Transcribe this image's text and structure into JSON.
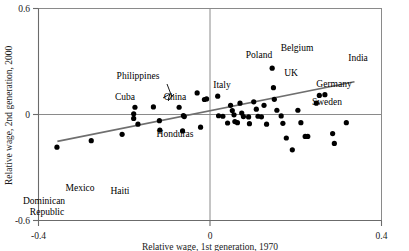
{
  "chart_data": {
    "type": "scatter",
    "title": "",
    "xlabel": "Relative wage, 1st generation, 1970",
    "ylabel": "Relative wage, 2nd generation, 2000",
    "xlim": [
      -0.4,
      0.4
    ],
    "ylim": [
      -0.6,
      0.6
    ],
    "xticks": [
      "-0.4",
      "0",
      "0.4"
    ],
    "xtick_values": [
      -0.4,
      0,
      0.4
    ],
    "yticks": [
      "0.6",
      "0",
      "-0.6"
    ],
    "ytick_values": [
      0.6,
      0,
      -0.6
    ],
    "grid": false,
    "legend": "none",
    "zero_lines": {
      "horizontal": true,
      "vertical": true
    },
    "trendline": {
      "label": "fitted regression line",
      "x_start": -0.356,
      "y_start": -0.152,
      "x_end": 0.337,
      "y_end": 0.185
    },
    "points": [
      {
        "x": -0.357,
        "y": -0.185,
        "label": "Dominican Republic"
      },
      {
        "x": -0.277,
        "y": -0.148,
        "label": "Mexico"
      },
      {
        "x": -0.205,
        "y": -0.112,
        "label": "Haiti"
      },
      {
        "x": -0.168,
        "y": -0.055,
        "label": ""
      },
      {
        "x": -0.175,
        "y": 0.041,
        "label": "Cuba"
      },
      {
        "x": -0.178,
        "y": 0.004,
        "label": ""
      },
      {
        "x": -0.178,
        "y": -0.022,
        "label": ""
      },
      {
        "x": -0.132,
        "y": 0.043,
        "label": ""
      },
      {
        "x": -0.118,
        "y": -0.035,
        "label": ""
      },
      {
        "x": -0.072,
        "y": 0.041,
        "label": "Philippines"
      },
      {
        "x": -0.062,
        "y": -0.006,
        "label": "China"
      },
      {
        "x": -0.06,
        "y": -0.012,
        "label": ""
      },
      {
        "x": -0.064,
        "y": -0.093,
        "label": "Honduras"
      },
      {
        "x": -0.117,
        "y": -0.088,
        "label": ""
      },
      {
        "x": -0.03,
        "y": 0.122,
        "label": ""
      },
      {
        "x": -0.008,
        "y": 0.088,
        "label": ""
      },
      {
        "x": -0.013,
        "y": 0.085,
        "label": ""
      },
      {
        "x": -0.022,
        "y": -0.072,
        "label": ""
      },
      {
        "x": 0.018,
        "y": 0.104,
        "label": "Italy"
      },
      {
        "x": 0.02,
        "y": -0.007,
        "label": ""
      },
      {
        "x": 0.03,
        "y": -0.01,
        "label": ""
      },
      {
        "x": 0.041,
        "y": -0.048,
        "label": ""
      },
      {
        "x": 0.048,
        "y": 0.052,
        "label": "Poland"
      },
      {
        "x": 0.052,
        "y": 0.022,
        "label": ""
      },
      {
        "x": 0.056,
        "y": -0.002,
        "label": ""
      },
      {
        "x": 0.058,
        "y": -0.04,
        "label": ""
      },
      {
        "x": 0.064,
        "y": -0.046,
        "label": ""
      },
      {
        "x": 0.07,
        "y": 0.064,
        "label": ""
      },
      {
        "x": 0.074,
        "y": 0.008,
        "label": ""
      },
      {
        "x": 0.078,
        "y": -0.012,
        "label": ""
      },
      {
        "x": 0.09,
        "y": -0.014,
        "label": ""
      },
      {
        "x": 0.092,
        "y": -0.052,
        "label": ""
      },
      {
        "x": 0.102,
        "y": 0.072,
        "label": ""
      },
      {
        "x": 0.108,
        "y": 0.03,
        "label": "UK"
      },
      {
        "x": 0.112,
        "y": -0.01,
        "label": ""
      },
      {
        "x": 0.12,
        "y": -0.013,
        "label": ""
      },
      {
        "x": 0.126,
        "y": 0.052,
        "label": ""
      },
      {
        "x": 0.132,
        "y": -0.055,
        "label": ""
      },
      {
        "x": 0.145,
        "y": 0.262,
        "label": ""
      },
      {
        "x": 0.148,
        "y": 0.152,
        "label": ""
      },
      {
        "x": 0.15,
        "y": 0.086,
        "label": "Belgium"
      },
      {
        "x": 0.156,
        "y": 0.024,
        "label": ""
      },
      {
        "x": 0.166,
        "y": -0.008,
        "label": ""
      },
      {
        "x": 0.17,
        "y": -0.05,
        "label": ""
      },
      {
        "x": 0.178,
        "y": -0.133,
        "label": ""
      },
      {
        "x": 0.192,
        "y": -0.2,
        "label": ""
      },
      {
        "x": 0.205,
        "y": 0.024,
        "label": ""
      },
      {
        "x": 0.212,
        "y": -0.046,
        "label": "Sweden"
      },
      {
        "x": 0.222,
        "y": -0.124,
        "label": ""
      },
      {
        "x": 0.228,
        "y": -0.124,
        "label": ""
      },
      {
        "x": 0.248,
        "y": 0.064,
        "label": "Germany"
      },
      {
        "x": 0.255,
        "y": 0.108,
        "label": ""
      },
      {
        "x": 0.268,
        "y": 0.112,
        "label": "India"
      },
      {
        "x": 0.286,
        "y": -0.108,
        "label": ""
      },
      {
        "x": 0.29,
        "y": -0.164,
        "label": ""
      },
      {
        "x": 0.318,
        "y": -0.046,
        "label": ""
      }
    ],
    "annotations": [
      {
        "text": "Dominican",
        "x": 44,
        "y": 204
      },
      {
        "text": "Republic",
        "x": 47,
        "y": 215
      },
      {
        "text": "Mexico",
        "x": 80,
        "y": 191
      },
      {
        "text": "Haiti",
        "x": 120,
        "y": 194
      },
      {
        "text": "Cuba",
        "x": 125,
        "y": 100
      },
      {
        "text": "Philippines",
        "x": 138,
        "y": 79
      },
      {
        "text": "China",
        "x": 175,
        "y": 100
      },
      {
        "text": "Honduras",
        "x": 175,
        "y": 137
      },
      {
        "text": "Italy",
        "x": 222,
        "y": 88
      },
      {
        "text": "Poland",
        "x": 259,
        "y": 58
      },
      {
        "text": "Belgium",
        "x": 297,
        "y": 51
      },
      {
        "text": "UK",
        "x": 291,
        "y": 76
      },
      {
        "text": "India",
        "x": 358,
        "y": 61
      },
      {
        "text": "Germany",
        "x": 334,
        "y": 87
      },
      {
        "text": "Sweden",
        "x": 327,
        "y": 105
      }
    ]
  },
  "axis": {
    "y_title": "Relative wage, 2nd generation, 2000",
    "x_title": "Relative wage, 1st generation, 1970",
    "y_top": "0.6",
    "y_mid": "0",
    "y_bottom": "-0.6",
    "x_left": "-0.4",
    "x_mid": "0",
    "x_right": "0.4"
  }
}
